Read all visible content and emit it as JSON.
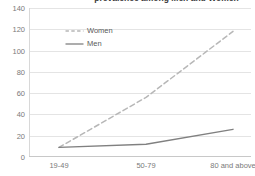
{
  "chart_data": {
    "type": "line",
    "title": "prevalence among Men and Women",
    "title_truncated": true,
    "xlabel": "",
    "ylabel": "",
    "categories": [
      "19-49",
      "50-79",
      "80 and above"
    ],
    "ylim": [
      0,
      140
    ],
    "yticks": [
      "0",
      "20",
      "40",
      "60",
      "80",
      "100",
      "120",
      "140"
    ],
    "ytick_values": [
      0,
      20,
      40,
      60,
      80,
      100,
      120,
      140
    ],
    "grid": true,
    "legend_position": "top-left inside plot",
    "series": [
      {
        "name": "Women",
        "values": [
          9,
          56,
          118
        ],
        "color": "#b7b7b7",
        "style": "dashed"
      },
      {
        "name": "Men",
        "values": [
          9,
          12,
          26
        ],
        "color": "#808080",
        "style": "solid"
      }
    ]
  },
  "legend": {
    "items": [
      {
        "label": "Women",
        "style": "dashed",
        "color": "#b7b7b7"
      },
      {
        "label": "Men",
        "style": "solid",
        "color": "#808080"
      }
    ]
  },
  "colors": {
    "gridline": "#e4e4e4",
    "axis": "#c8c8c8",
    "tick_text": "#7a7a7a",
    "title_text": "#3a3a3a",
    "background": "#ffffff"
  }
}
